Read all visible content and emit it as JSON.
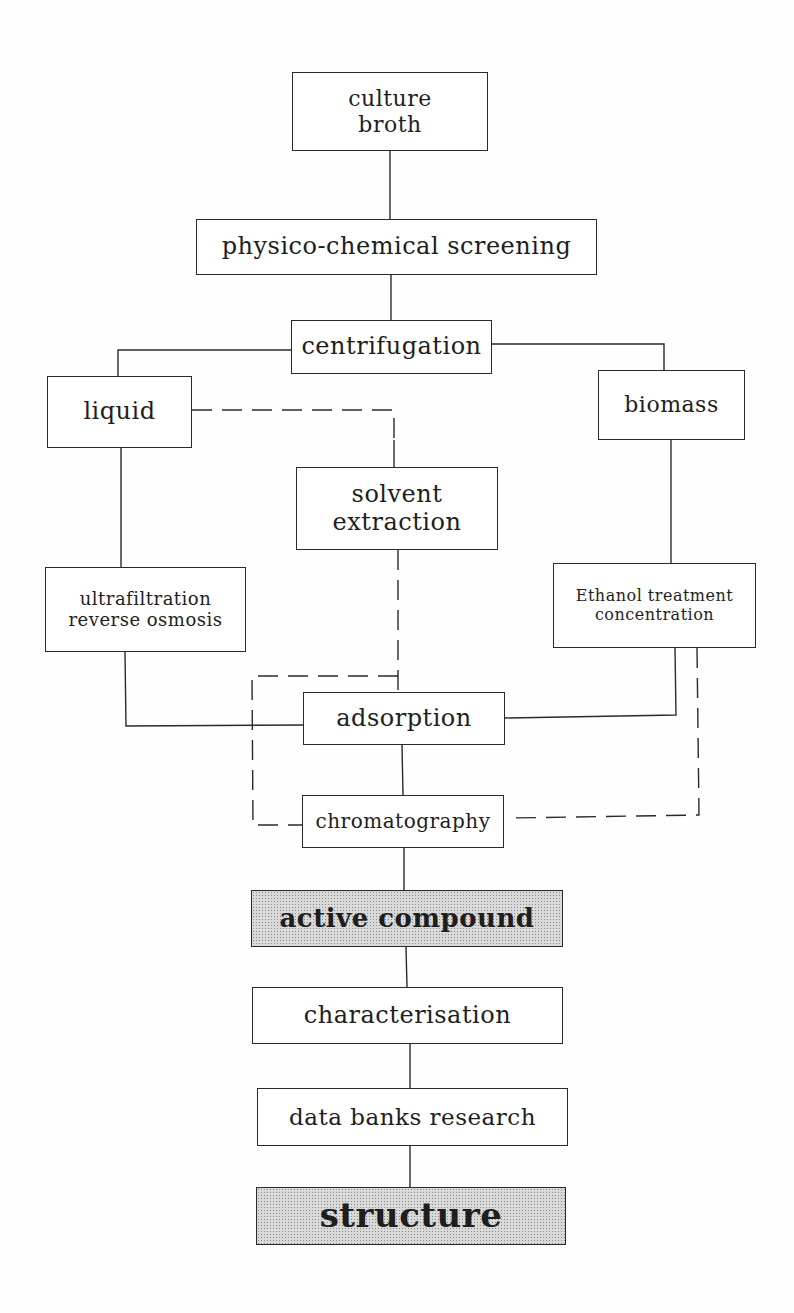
{
  "diagram": {
    "type": "flowchart",
    "nodes": {
      "culture_broth": {
        "line1": "culture",
        "line2": "broth"
      },
      "screening": {
        "label": "physico-chemical screening"
      },
      "centrifugation": {
        "label": "centrifugation"
      },
      "liquid": {
        "label": "liquid"
      },
      "biomass": {
        "label": "biomass"
      },
      "solvent_extraction": {
        "line1": "solvent",
        "line2": "extraction"
      },
      "ultrafiltration": {
        "line1": "ultrafiltration",
        "line2": "reverse osmosis"
      },
      "ethanol": {
        "line1": "Ethanol treatment",
        "line2": "concentration"
      },
      "adsorption": {
        "label": "adsorption"
      },
      "chromatography": {
        "label": "chromatography"
      },
      "active_compound": {
        "label": "active compound",
        "shaded": true
      },
      "characterisation": {
        "label": "characterisation"
      },
      "data_banks": {
        "label": "data banks research"
      },
      "structure": {
        "label": "structure",
        "shaded": true
      }
    },
    "edges": [
      {
        "from": "culture broth",
        "to": "physico-chemical screening",
        "style": "solid"
      },
      {
        "from": "physico-chemical screening",
        "to": "centrifugation",
        "style": "solid"
      },
      {
        "from": "centrifugation",
        "to": "liquid",
        "style": "solid"
      },
      {
        "from": "centrifugation",
        "to": "biomass",
        "style": "solid"
      },
      {
        "from": "liquid",
        "to": "solvent extraction",
        "style": "dashed"
      },
      {
        "from": "liquid",
        "to": "ultrafiltration reverse osmosis",
        "style": "solid"
      },
      {
        "from": "biomass",
        "to": "Ethanol treatment concentration",
        "style": "solid"
      },
      {
        "from": "solvent extraction",
        "to": "adsorption",
        "style": "dashed"
      },
      {
        "from": "solvent extraction",
        "to": "chromatography",
        "style": "dashed"
      },
      {
        "from": "ultrafiltration reverse osmosis",
        "to": "adsorption",
        "style": "solid"
      },
      {
        "from": "Ethanol treatment concentration",
        "to": "adsorption",
        "style": "solid"
      },
      {
        "from": "Ethanol treatment concentration",
        "to": "chromatography",
        "style": "dashed"
      },
      {
        "from": "adsorption",
        "to": "chromatography",
        "style": "solid"
      },
      {
        "from": "chromatography",
        "to": "active compound",
        "style": "solid"
      },
      {
        "from": "active compound",
        "to": "characterisation",
        "style": "solid"
      },
      {
        "from": "characterisation",
        "to": "data banks research",
        "style": "solid"
      },
      {
        "from": "data banks research",
        "to": "structure",
        "style": "solid"
      }
    ],
    "colors": {
      "line": "#2a2a2a",
      "shade": "#d9d9d9"
    }
  }
}
